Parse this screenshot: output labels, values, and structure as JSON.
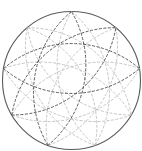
{
  "diagram": {
    "type": "nine-point lens rosette inscribed in a circle",
    "outer_circle": {
      "cx": 71.5,
      "cy": 80.5,
      "r": 69,
      "stroke": "#5a5a5a"
    },
    "vertex_count": 9,
    "start_angle_deg": 0,
    "step": 4,
    "lens_arc_radius": 105,
    "colors": {
      "dark": "#4a4a4a",
      "light": "#b8b8b8",
      "background": "#ffffff"
    },
    "dark_lenses": [
      5,
      6,
      7
    ],
    "dash": "3,1.5"
  }
}
